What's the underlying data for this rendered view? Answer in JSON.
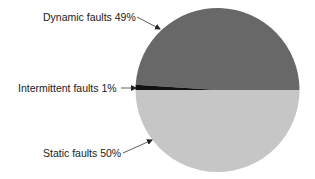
{
  "chart_data": {
    "type": "pie",
    "title": "",
    "slices": [
      {
        "label": "Dynamic faults",
        "value": 49,
        "display": "Dynamic faults 49%",
        "color": "#686868"
      },
      {
        "label": "Intermittent faults",
        "value": 1,
        "display": "Intermittent faults 1%",
        "color": "#111111"
      },
      {
        "label": "Static faults",
        "value": 50,
        "display": "Static faults 50%",
        "color": "#c6c6c6"
      }
    ],
    "legend": "none (callout labels with arrows)",
    "start_angle_deg": 0,
    "direction": "counterclockwise from 3 o'clock"
  },
  "labels": {
    "dynamic": "Dynamic faults 49%",
    "intermittent": "Intermittent faults 1%",
    "static": "Static faults 50%"
  },
  "colors": {
    "dynamic": "#686868",
    "intermittent": "#111111",
    "static": "#c6c6c6",
    "arrow": "#222222"
  }
}
